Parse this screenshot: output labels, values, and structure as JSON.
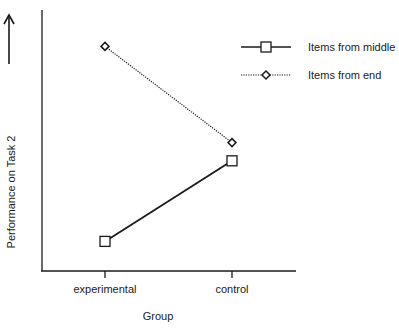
{
  "chart_data": {
    "type": "line",
    "title": "",
    "xlabel": "Group",
    "ylabel": "Performance on Task 2",
    "ylabel_arrow": "increasing",
    "categories": [
      "experimental",
      "control"
    ],
    "ylim": [
      0,
      1
    ],
    "y_units": "relative (no numeric scale shown)",
    "grid": false,
    "legend_position": "top-right",
    "series": [
      {
        "name": "Items from middle",
        "line": "solid",
        "marker": "square",
        "values": [
          0.11,
          0.42
        ]
      },
      {
        "name": "Items from end",
        "line": "dotted",
        "marker": "diamond",
        "values": [
          0.86,
          0.49
        ]
      }
    ]
  }
}
